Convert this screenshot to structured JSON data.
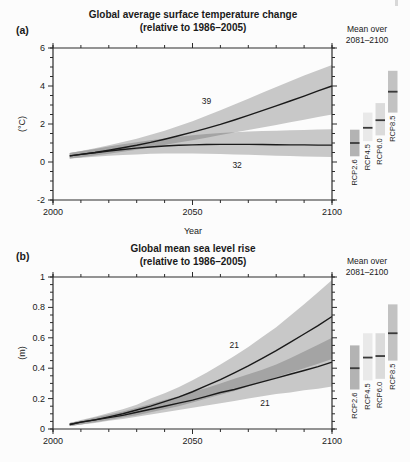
{
  "panels": {
    "a_label": "(a)",
    "b_label": "(b)"
  },
  "colors": {
    "paper": "#fcfcfc",
    "band": "#c8c8c8",
    "band_overlap": "#a4a4a4",
    "mean_line": "#1a1a1a",
    "frame": "#2b2b2b",
    "bar_mean_mark": "#3a3a3a",
    "text": "#1a1a1a"
  },
  "chart_data": [
    {
      "id": "temperature",
      "type": "area",
      "title": "Global average surface temperature change",
      "subtitle": "(relative to 1986–2005)",
      "xlabel": "Year",
      "ylabel": "(°C)",
      "xlim": [
        2000,
        2100
      ],
      "ylim": [
        -2,
        6
      ],
      "xticks": [
        2000,
        2050,
        2100
      ],
      "xtick_labels": [
        "2000",
        "2050",
        "2100"
      ],
      "xtick_minor_step": 10,
      "yticks": [
        -2,
        0,
        2,
        4,
        6
      ],
      "ytick_labels": [
        "-2",
        "0",
        "2",
        "4",
        "6"
      ],
      "ytick_minor_step": 0.5,
      "grid": false,
      "x": [
        2006,
        2010,
        2015,
        2020,
        2025,
        2030,
        2035,
        2040,
        2045,
        2050,
        2055,
        2060,
        2065,
        2070,
        2075,
        2080,
        2085,
        2090,
        2095,
        2100
      ],
      "series": [
        {
          "name": "RCP8.5",
          "model_count": "39",
          "mean": [
            0.32,
            0.4,
            0.5,
            0.62,
            0.75,
            0.88,
            1.03,
            1.2,
            1.38,
            1.57,
            1.77,
            1.98,
            2.21,
            2.45,
            2.7,
            2.95,
            3.21,
            3.47,
            3.74,
            4.0
          ],
          "upper": [
            0.48,
            0.58,
            0.72,
            0.88,
            1.05,
            1.23,
            1.43,
            1.65,
            1.89,
            2.15,
            2.43,
            2.72,
            3.02,
            3.33,
            3.64,
            3.95,
            4.25,
            4.55,
            4.83,
            5.1
          ],
          "lower": [
            0.18,
            0.25,
            0.34,
            0.44,
            0.54,
            0.65,
            0.77,
            0.9,
            1.02,
            1.15,
            1.28,
            1.42,
            1.55,
            1.68,
            1.82,
            1.95,
            2.09,
            2.23,
            2.37,
            2.5
          ]
        },
        {
          "name": "RCP2.6",
          "model_count": "32",
          "mean": [
            0.32,
            0.4,
            0.49,
            0.58,
            0.66,
            0.73,
            0.79,
            0.84,
            0.88,
            0.9,
            0.92,
            0.93,
            0.93,
            0.93,
            0.92,
            0.91,
            0.9,
            0.9,
            0.89,
            0.89
          ],
          "upper": [
            0.48,
            0.57,
            0.69,
            0.81,
            0.93,
            1.04,
            1.14,
            1.24,
            1.33,
            1.41,
            1.47,
            1.53,
            1.57,
            1.6,
            1.63,
            1.65,
            1.67,
            1.69,
            1.71,
            1.73
          ],
          "lower": [
            0.18,
            0.22,
            0.28,
            0.33,
            0.37,
            0.4,
            0.43,
            0.45,
            0.45,
            0.45,
            0.44,
            0.42,
            0.4,
            0.38,
            0.35,
            0.33,
            0.31,
            0.29,
            0.27,
            0.26
          ]
        }
      ],
      "annotations": [
        {
          "label": "39",
          "year": 2055,
          "value": 3.2
        },
        {
          "label": "32",
          "year": 2066,
          "value": -0.15
        }
      ],
      "side_bars": {
        "header_line1": "Mean over",
        "header_line2": "2081–2100",
        "bars": [
          {
            "name": "RCP2.6",
            "low": 0.3,
            "high": 1.7,
            "mean": 1.0,
            "fill": "#b3b3b3"
          },
          {
            "name": "RCP4.5",
            "low": 1.1,
            "high": 2.6,
            "mean": 1.8,
            "fill": "#e9e9e9"
          },
          {
            "name": "RCP6.0",
            "low": 1.4,
            "high": 3.1,
            "mean": 2.2,
            "fill": "#dbdbdb"
          },
          {
            "name": "RCP8.5",
            "low": 2.6,
            "high": 4.8,
            "mean": 3.7,
            "fill": "#c2c2c2"
          }
        ]
      }
    },
    {
      "id": "sea-level",
      "type": "area",
      "title": "Global mean sea level rise",
      "subtitle": "(relative to 1986–2005)",
      "xlabel": "",
      "ylabel": "(m)",
      "xlim": [
        2000,
        2100
      ],
      "ylim": [
        0,
        1
      ],
      "xticks": [
        2000,
        2050,
        2100
      ],
      "xtick_labels": [
        "2000",
        "2050",
        "2100"
      ],
      "xtick_minor_step": 10,
      "yticks": [
        0,
        0.2,
        0.4,
        0.6,
        0.8,
        1
      ],
      "ytick_labels": [
        "0",
        "0.2",
        "0.4",
        "0.6",
        "0.8",
        "1"
      ],
      "ytick_minor_step": 0.05,
      "grid": false,
      "x": [
        2006,
        2010,
        2015,
        2020,
        2025,
        2030,
        2035,
        2040,
        2045,
        2050,
        2055,
        2060,
        2065,
        2070,
        2075,
        2080,
        2085,
        2090,
        2095,
        2100
      ],
      "series": [
        {
          "name": "RCP8.5",
          "model_count": "21",
          "mean": [
            0.03,
            0.045,
            0.06,
            0.08,
            0.1,
            0.125,
            0.15,
            0.18,
            0.21,
            0.245,
            0.285,
            0.325,
            0.37,
            0.415,
            0.465,
            0.515,
            0.57,
            0.625,
            0.68,
            0.74
          ],
          "upper": [
            0.04,
            0.06,
            0.08,
            0.105,
            0.13,
            0.16,
            0.2,
            0.235,
            0.275,
            0.32,
            0.37,
            0.425,
            0.48,
            0.54,
            0.605,
            0.67,
            0.745,
            0.82,
            0.9,
            0.98
          ],
          "lower": [
            0.02,
            0.03,
            0.045,
            0.06,
            0.075,
            0.09,
            0.11,
            0.13,
            0.15,
            0.175,
            0.2,
            0.225,
            0.25,
            0.28,
            0.31,
            0.34,
            0.37,
            0.4,
            0.43,
            0.46
          ]
        },
        {
          "name": "RCP2.6",
          "model_count": "21",
          "mean": [
            0.03,
            0.045,
            0.06,
            0.075,
            0.09,
            0.11,
            0.13,
            0.15,
            0.17,
            0.19,
            0.215,
            0.24,
            0.26,
            0.285,
            0.31,
            0.335,
            0.36,
            0.385,
            0.41,
            0.44
          ],
          "upper": [
            0.04,
            0.055,
            0.075,
            0.095,
            0.115,
            0.14,
            0.165,
            0.19,
            0.215,
            0.245,
            0.27,
            0.3,
            0.33,
            0.36,
            0.39,
            0.425,
            0.465,
            0.51,
            0.555,
            0.6
          ],
          "lower": [
            0.02,
            0.03,
            0.04,
            0.055,
            0.065,
            0.08,
            0.095,
            0.11,
            0.125,
            0.14,
            0.155,
            0.17,
            0.185,
            0.2,
            0.215,
            0.23,
            0.24,
            0.255,
            0.265,
            0.28
          ]
        }
      ],
      "annotations": [
        {
          "label": "21",
          "year": 2065,
          "value": 0.55
        },
        {
          "label": "21",
          "year": 2076,
          "value": 0.17
        }
      ],
      "side_bars": {
        "header_line1": "Mean over",
        "header_line2": "2081–2100",
        "bars": [
          {
            "name": "RCP2.6",
            "low": 0.26,
            "high": 0.55,
            "mean": 0.4,
            "fill": "#b3b3b3"
          },
          {
            "name": "RCP4.5",
            "low": 0.32,
            "high": 0.63,
            "mean": 0.47,
            "fill": "#e9e9e9"
          },
          {
            "name": "RCP6.0",
            "low": 0.33,
            "high": 0.63,
            "mean": 0.48,
            "fill": "#dbdbdb"
          },
          {
            "name": "RCP8.5",
            "low": 0.45,
            "high": 0.82,
            "mean": 0.63,
            "fill": "#c2c2c2"
          }
        ]
      }
    }
  ]
}
